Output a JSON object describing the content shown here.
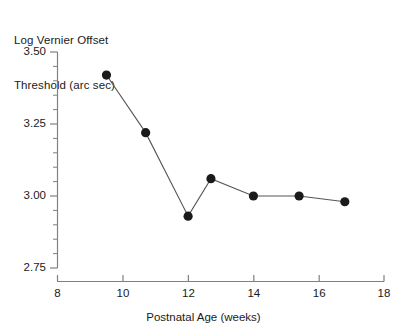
{
  "chart_data": {
    "type": "line",
    "title": "",
    "ylabel": "Log Vernier Offset Threshold (arc sec)",
    "ylabel_line1": "Log Vernier Offset",
    "ylabel_line2": "Threshold (arc sec)",
    "xlabel": "Postnatal Age (weeks)",
    "x": [
      9.5,
      10.7,
      12.0,
      12.7,
      14.0,
      15.4,
      16.8
    ],
    "values": [
      3.42,
      3.22,
      2.93,
      3.06,
      3.0,
      3.0,
      2.98
    ],
    "series": [
      {
        "name": "Vernier threshold",
        "x": [
          9.5,
          10.7,
          12.0,
          12.7,
          14.0,
          15.4,
          16.8
        ],
        "values": [
          3.42,
          3.22,
          2.93,
          3.06,
          3.0,
          3.0,
          2.98
        ]
      }
    ],
    "xlim": [
      8,
      18
    ],
    "ylim": [
      2.75,
      3.5
    ],
    "xticks": [
      8,
      10,
      12,
      14,
      16,
      18
    ],
    "xtick_labels": [
      "8",
      "10",
      "12",
      "14",
      "16",
      "18"
    ],
    "yticks": [
      2.75,
      3.0,
      3.25,
      3.5
    ],
    "ytick_labels": [
      "2.75",
      "3.00",
      "3.25",
      "3.50"
    ],
    "y_minor_step": 0.05,
    "grid": false,
    "legend": false,
    "marker": "filled-circle",
    "marker_color": "#1a1a1a",
    "line_color": "#555555",
    "axis_color": "#808080"
  }
}
